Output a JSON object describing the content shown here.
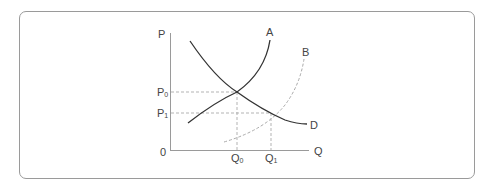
{
  "diagram": {
    "type": "supply-demand-shift",
    "axes": {
      "y_label": "P",
      "x_label": "Q",
      "origin_label": "0"
    },
    "curves": [
      {
        "id": "A",
        "label": "A",
        "style": "solid",
        "role": "original supply"
      },
      {
        "id": "B",
        "label": "B",
        "style": "dashed",
        "role": "shifted supply"
      },
      {
        "id": "D",
        "label": "D",
        "style": "solid",
        "role": "demand"
      }
    ],
    "price_levels": [
      {
        "label": "P",
        "subscript": "0"
      },
      {
        "label": "P",
        "subscript": "1"
      }
    ],
    "quantity_levels": [
      {
        "label": "Q",
        "subscript": "0"
      },
      {
        "label": "Q",
        "subscript": "1"
      }
    ],
    "colors": {
      "frame": "#9a9a9a",
      "axis": "#9a9a9a",
      "curve": "#333333",
      "dashed": "#aaaaaa",
      "text": "#444444"
    }
  }
}
